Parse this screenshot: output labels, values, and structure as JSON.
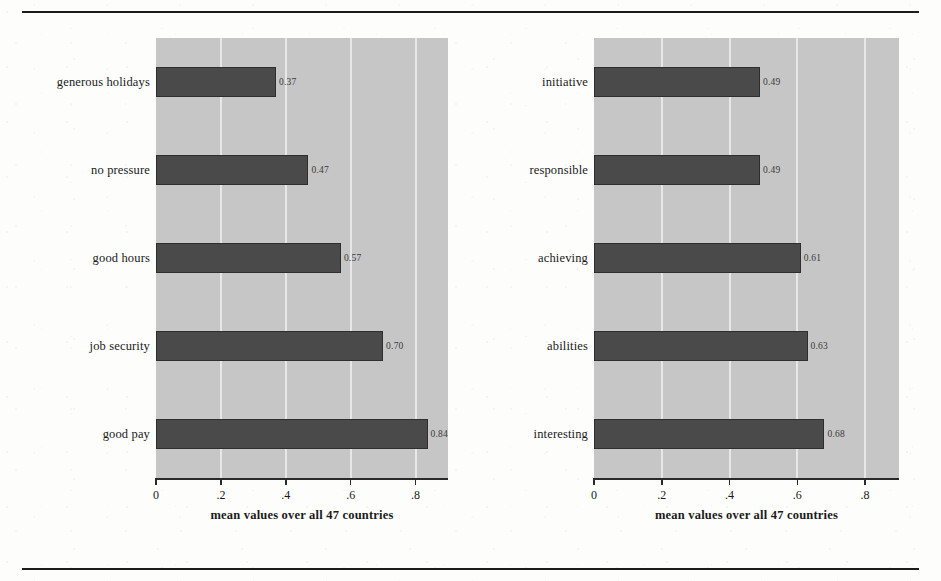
{
  "chart_data": [
    {
      "type": "bar",
      "orientation": "horizontal",
      "panel": "left",
      "title": "",
      "categories": [
        "generous holidays",
        "no pressure",
        "good hours",
        "job security",
        "good pay"
      ],
      "values": [
        0.37,
        0.47,
        0.57,
        0.7,
        0.84
      ],
      "value_labels": [
        "0.37",
        "0.47",
        "0.57",
        "0.70",
        "0.84"
      ],
      "xlabel": "mean values over all 47 countries",
      "ylabel": "",
      "xlim": [
        0,
        0.9
      ],
      "xticks": [
        0,
        0.2,
        0.4,
        0.6,
        0.8
      ],
      "xtick_labels": [
        "0",
        ".2",
        ".4",
        ".6",
        ".8"
      ],
      "grid": true,
      "legend": "none",
      "bar_color": "#4a4a4a",
      "plot_background": "#c6c6c6"
    },
    {
      "type": "bar",
      "orientation": "horizontal",
      "panel": "right",
      "title": "",
      "categories": [
        "initiative",
        "responsible",
        "achieving",
        "abilities",
        "interesting"
      ],
      "values": [
        0.49,
        0.49,
        0.61,
        0.63,
        0.68
      ],
      "value_labels": [
        "0.49",
        "0.49",
        "0.61",
        "0.63",
        "0.68"
      ],
      "xlabel": "mean values over all 47 countries",
      "ylabel": "",
      "xlim": [
        0,
        0.9
      ],
      "xticks": [
        0,
        0.2,
        0.4,
        0.6,
        0.8
      ],
      "xtick_labels": [
        "0",
        ".2",
        ".4",
        ".6",
        ".8"
      ],
      "grid": true,
      "legend": "none",
      "bar_color": "#4a4a4a",
      "plot_background": "#c6c6c6"
    }
  ]
}
